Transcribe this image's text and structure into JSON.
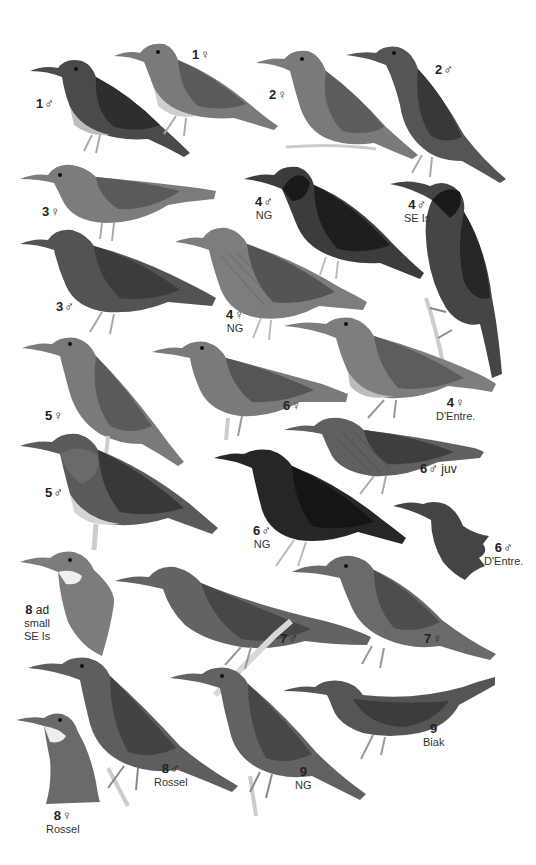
{
  "plate": {
    "background": "#ffffff",
    "labels": [
      {
        "id": "1m",
        "num": "1",
        "sex": "♂",
        "sub": ""
      },
      {
        "id": "1f",
        "num": "1",
        "sex": "♀",
        "sub": ""
      },
      {
        "id": "2f",
        "num": "2",
        "sex": "♀",
        "sub": ""
      },
      {
        "id": "2m",
        "num": "2",
        "sex": "♂",
        "sub": ""
      },
      {
        "id": "3f",
        "num": "3",
        "sex": "♀",
        "sub": ""
      },
      {
        "id": "4m_ng",
        "num": "4",
        "sex": "♂",
        "sub": "NG"
      },
      {
        "id": "4m_se",
        "num": "4",
        "sex": "♂",
        "sub": "SE Is"
      },
      {
        "id": "3m",
        "num": "3",
        "sex": "♂",
        "sub": ""
      },
      {
        "id": "4f_ng",
        "num": "4",
        "sex": "♀",
        "sub": "NG"
      },
      {
        "id": "5f",
        "num": "5",
        "sex": "♀",
        "sub": ""
      },
      {
        "id": "6f",
        "num": "6",
        "sex": "♀",
        "sub": ""
      },
      {
        "id": "4f_de",
        "num": "4",
        "sex": "♀",
        "sub": "D'Entre."
      },
      {
        "id": "6m_juv",
        "num": "6",
        "sex": "♂",
        "sub": "juv"
      },
      {
        "id": "5m",
        "num": "5",
        "sex": "♂",
        "sub": ""
      },
      {
        "id": "6m_ng",
        "num": "6",
        "sex": "♂",
        "sub": "NG"
      },
      {
        "id": "6m_de",
        "num": "6",
        "sex": "♂",
        "sub": "D'Entre."
      },
      {
        "id": "8ad",
        "num": "8",
        "sex": "",
        "sub": "ad small SE Is"
      },
      {
        "id": "7m",
        "num": "7",
        "sex": "♂",
        "sub": ""
      },
      {
        "id": "7f",
        "num": "7",
        "sex": "♀",
        "sub": ""
      },
      {
        "id": "8m_ro",
        "num": "8",
        "sex": "♂",
        "sub": "Rossel"
      },
      {
        "id": "9_ng",
        "num": "9",
        "sex": "",
        "sub": "NG"
      },
      {
        "id": "9_bi",
        "num": "9",
        "sex": "",
        "sub": "Biak"
      },
      {
        "id": "8f_ro",
        "num": "8",
        "sex": "♀",
        "sub": "Rossel"
      }
    ]
  },
  "labels": {
    "l1m": {
      "num": "1",
      "sex": "♂"
    },
    "l1f": {
      "num": "1",
      "sex": "♀"
    },
    "l2f": {
      "num": "2",
      "sex": "♀"
    },
    "l2m": {
      "num": "2",
      "sex": "♂"
    },
    "l3f": {
      "num": "3",
      "sex": "♀"
    },
    "l4m_ng": {
      "num": "4",
      "sex": "♂",
      "sub": "NG"
    },
    "l4m_se": {
      "num": "4",
      "sex": "♂",
      "sub": "SE Is"
    },
    "l3m": {
      "num": "3",
      "sex": "♂"
    },
    "l4f_ng": {
      "num": "4",
      "sex": "♀",
      "sub": "NG"
    },
    "l5f": {
      "num": "5",
      "sex": "♀"
    },
    "l6f": {
      "num": "6",
      "sex": "♀"
    },
    "l4f_de": {
      "num": "4",
      "sex": "♀",
      "sub": "D'Entre."
    },
    "l6m_juv": {
      "num": "6",
      "sex": "♂",
      "extra": "juv"
    },
    "l5m": {
      "num": "5",
      "sex": "♂"
    },
    "l6m_ng": {
      "num": "6",
      "sex": "♂",
      "sub": "NG"
    },
    "l6m_de": {
      "num": "6",
      "sex": "♂",
      "sub": "D'Entre."
    },
    "l8ad": {
      "num": "8",
      "extra": "ad",
      "sub1": "small",
      "sub2": "SE Is"
    },
    "l7m": {
      "num": "7",
      "sex": "♂"
    },
    "l7f": {
      "num": "7",
      "sex": "♀"
    },
    "l8m_ro": {
      "num": "8",
      "sex": "♂",
      "sub": "Rossel"
    },
    "l9_ng": {
      "num": "9",
      "sub": "NG"
    },
    "l9_bi": {
      "num": "9",
      "sub": "Biak"
    },
    "l8f_ro": {
      "num": "8",
      "sex": "♀",
      "sub": "Rossel"
    }
  },
  "colors": {
    "dark": "#2e2e2e",
    "mid": "#5a5a5a",
    "light": "#8c8c8c",
    "pale": "#b8b8b8",
    "perch": "#d0d0d0"
  }
}
